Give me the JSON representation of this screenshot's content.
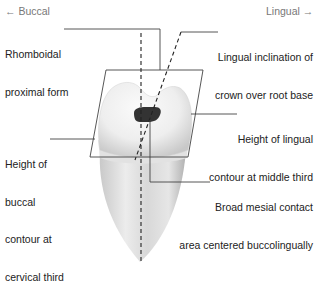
{
  "directions": {
    "buccal": "← Buccal",
    "lingual": "Lingual →"
  },
  "labels": {
    "rhomboidal_line1": "Rhomboidal",
    "rhomboidal_line2": "proximal form",
    "lingual_incl_line1": "Lingual inclination of",
    "lingual_incl_line2": "crown over root base",
    "buccal_height_line1": "Height of",
    "buccal_height_line2": "buccal",
    "buccal_height_line3": "contour at",
    "buccal_height_line4": "cervical third",
    "lingual_height_line1": "Height of lingual",
    "lingual_height_line2": "contour at middle third",
    "mesial_contact_line1": "Broad mesial contact",
    "mesial_contact_line2": "area centered buccolingually"
  },
  "colors": {
    "line": "#333333",
    "tooth_light": "#f2f2f2",
    "tooth_mid": "#d4d4d4",
    "tooth_dark": "#a8a8a8",
    "contact_area": "#333333",
    "direction_text": "#777777"
  }
}
